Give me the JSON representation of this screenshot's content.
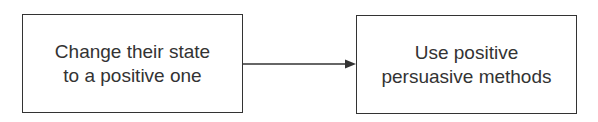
{
  "diagram": {
    "nodes": [
      {
        "id": "n1",
        "lines": [
          "Change their state",
          "to a positive one"
        ]
      },
      {
        "id": "n2",
        "lines": [
          "Use positive",
          "persuasive methods"
        ]
      }
    ],
    "edges": [
      {
        "from": "n1",
        "to": "n2"
      }
    ]
  }
}
